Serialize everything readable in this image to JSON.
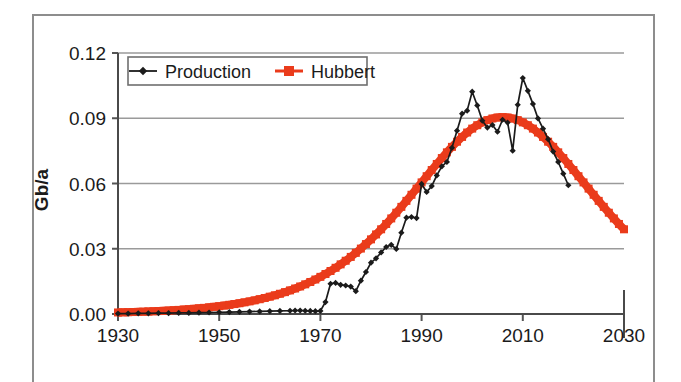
{
  "chart_data": {
    "type": "line",
    "title": "",
    "subtitle": "",
    "xlabel": "",
    "ylabel": "Gb/a",
    "xlim": [
      1930,
      2030
    ],
    "ylim": [
      0.0,
      0.12
    ],
    "grid": "horizontal",
    "legend_position": "top-left-inside",
    "x_ticks": [
      "1930",
      "1950",
      "1970",
      "1990",
      "2010",
      "2030"
    ],
    "x_tick_values": [
      1930,
      1950,
      1970,
      1990,
      2010,
      2030
    ],
    "y_ticks": [
      "0.00",
      "0.03",
      "0.06",
      "0.09",
      "0.12"
    ],
    "y_tick_values": [
      0.0,
      0.03,
      0.06,
      0.09,
      0.12
    ],
    "colors": {
      "production": "#1b1b1b",
      "hubbert": "#ea3b1b",
      "grid": "#9a9a9a",
      "axis": "#555555",
      "frame": "#8d8d8d",
      "background": "#ffffff"
    },
    "series": [
      {
        "name": "Production",
        "marker": "diamond",
        "color": "#1b1b1b",
        "x": [
          1930,
          1932,
          1934,
          1936,
          1938,
          1940,
          1942,
          1944,
          1946,
          1948,
          1950,
          1952,
          1954,
          1956,
          1958,
          1960,
          1962,
          1964,
          1965,
          1966,
          1967,
          1968,
          1969,
          1970,
          1971,
          1972,
          1973,
          1974,
          1975,
          1976,
          1977,
          1978,
          1979,
          1980,
          1981,
          1982,
          1983,
          1984,
          1985,
          1986,
          1987,
          1988,
          1989,
          1990,
          1991,
          1992,
          1993,
          1994,
          1995,
          1996,
          1997,
          1998,
          1999,
          2000,
          2001,
          2002,
          2003,
          2004,
          2005,
          2006,
          2007,
          2008,
          2009,
          2010,
          2011,
          2012,
          2013,
          2014,
          2015,
          2016,
          2017,
          2018,
          2019
        ],
        "y": [
          0.0002,
          0.0002,
          0.0003,
          0.0003,
          0.0004,
          0.0004,
          0.0005,
          0.0005,
          0.0006,
          0.0007,
          0.0008,
          0.0009,
          0.001,
          0.0011,
          0.0012,
          0.0013,
          0.0014,
          0.0015,
          0.0016,
          0.0016,
          0.0015,
          0.0014,
          0.0013,
          0.0014,
          0.0055,
          0.0139,
          0.0143,
          0.0134,
          0.0131,
          0.0126,
          0.0105,
          0.0153,
          0.0193,
          0.0236,
          0.0256,
          0.0283,
          0.0308,
          0.0318,
          0.0299,
          0.0374,
          0.0443,
          0.0446,
          0.0441,
          0.0598,
          0.0561,
          0.0588,
          0.0637,
          0.0679,
          0.0699,
          0.0764,
          0.0843,
          0.0921,
          0.0935,
          0.1022,
          0.0959,
          0.0889,
          0.0857,
          0.0869,
          0.0838,
          0.0893,
          0.088,
          0.0751,
          0.0962,
          0.1085,
          0.1026,
          0.0966,
          0.0899,
          0.0852,
          0.0804,
          0.0747,
          0.0699,
          0.0645,
          0.0592
        ]
      },
      {
        "name": "Hubbert",
        "marker": "square",
        "color": "#ea3b1b",
        "curve": "logistic-derivative",
        "peak_year": 2006,
        "peak_value": 0.0905,
        "width_k": 0.082,
        "x": [
          1930,
          1931,
          1932,
          1933,
          1934,
          1935,
          1936,
          1937,
          1938,
          1939,
          1940,
          1941,
          1942,
          1943,
          1944,
          1945,
          1946,
          1947,
          1948,
          1949,
          1950,
          1951,
          1952,
          1953,
          1954,
          1955,
          1956,
          1957,
          1958,
          1959,
          1960,
          1961,
          1962,
          1963,
          1964,
          1965,
          1966,
          1967,
          1968,
          1969,
          1970,
          1971,
          1972,
          1973,
          1974,
          1975,
          1976,
          1977,
          1978,
          1979,
          1980,
          1981,
          1982,
          1983,
          1984,
          1985,
          1986,
          1987,
          1988,
          1989,
          1990,
          1991,
          1992,
          1993,
          1994,
          1995,
          1996,
          1997,
          1998,
          1999,
          2000,
          2001,
          2002,
          2003,
          2004,
          2005,
          2006,
          2007,
          2008,
          2009,
          2010,
          2011,
          2012,
          2013,
          2014,
          2015,
          2016,
          2017,
          2018,
          2019,
          2020,
          2021,
          2022,
          2023,
          2024,
          2025,
          2026,
          2027,
          2028,
          2029,
          2030
        ],
        "y_endpoints": {
          "start": 0.0009,
          "end": 0.031
        }
      }
    ],
    "annotations": []
  },
  "legend": {
    "items": [
      {
        "label": "Production",
        "marker": "diamond",
        "color": "#1b1b1b"
      },
      {
        "label": "Hubbert",
        "marker": "square",
        "color": "#ea3b1b"
      }
    ]
  },
  "axes": {
    "y_label": "Gb/a"
  }
}
